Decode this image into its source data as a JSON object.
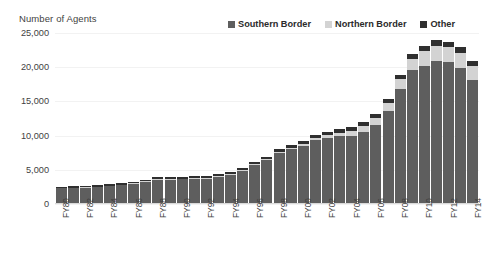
{
  "chart_data": {
    "type": "bar",
    "subtype": "stacked-bar",
    "title": "",
    "ylabel": "Number of Agents",
    "xlabel": "",
    "ylim": [
      0,
      25000
    ],
    "ytick_labels": [
      "25,000",
      "20,000",
      "15,000",
      "10,000",
      "5,000",
      "0"
    ],
    "ytick_values": [
      25000,
      20000,
      15000,
      10000,
      5000,
      0
    ],
    "grid": true,
    "legend_position": "top-right",
    "categories": [
      "FY80",
      "FY81",
      "FY82",
      "FY83",
      "FY84",
      "FY85",
      "FY86",
      "FY87",
      "FY88",
      "FY89",
      "FY90",
      "FY91",
      "FY92",
      "FY93",
      "FY94",
      "FY95",
      "FY96",
      "FY97",
      "FY98",
      "FY99",
      "FY00",
      "FY01",
      "FY02",
      "FY03",
      "FY04",
      "FY05",
      "FY06",
      "FY07",
      "FY08",
      "FY09",
      "FY10",
      "FY11",
      "FY12",
      "FY13",
      "FY14"
    ],
    "xtick_labels": [
      "FY80",
      "",
      "FY82",
      "",
      "FY84",
      "",
      "FY86",
      "",
      "FY88",
      "",
      "FY90",
      "",
      "FY92",
      "",
      "FY94",
      "",
      "FY96",
      "",
      "FY98",
      "",
      "FY00",
      "",
      "FY02",
      "",
      "FY04",
      "",
      "FY06",
      "",
      "FY08",
      "",
      "FY10",
      "",
      "FY12",
      "",
      "FY14"
    ],
    "series": [
      {
        "name": "Southern Border",
        "color": "#5e5e5e",
        "values": [
          2150,
          2200,
          2250,
          2350,
          2450,
          2600,
          2800,
          3100,
          3400,
          3400,
          3500,
          3550,
          3600,
          3800,
          4100,
          4700,
          5600,
          6300,
          7400,
          7900,
          8400,
          9200,
          9600,
          9800,
          9900,
          10500,
          11500,
          13600,
          16800,
          19500,
          20100,
          20900,
          20700,
          19900,
          18100
        ]
      },
      {
        "name": "Northern Border",
        "color": "#d3d3d3",
        "values": [
          70,
          70,
          75,
          75,
          80,
          80,
          85,
          90,
          95,
          95,
          100,
          100,
          105,
          110,
          115,
          120,
          130,
          140,
          150,
          160,
          300,
          340,
          360,
          550,
          750,
          900,
          950,
          1100,
          1400,
          1700,
          2200,
          2200,
          2200,
          2200,
          2100
        ]
      },
      {
        "name": "Other",
        "color": "#2f2f2f",
        "values": [
          200,
          200,
          200,
          210,
          220,
          230,
          240,
          250,
          260,
          260,
          270,
          270,
          280,
          290,
          300,
          320,
          340,
          360,
          400,
          420,
          450,
          480,
          500,
          520,
          540,
          560,
          600,
          650,
          700,
          750,
          800,
          850,
          850,
          800,
          750
        ]
      }
    ]
  },
  "legend": {
    "entries": [
      {
        "label": "Southern Border",
        "color": "#5e5e5e"
      },
      {
        "label": "Northern Border",
        "color": "#d3d3d3"
      },
      {
        "label": "Other",
        "color": "#2f2f2f"
      }
    ]
  }
}
